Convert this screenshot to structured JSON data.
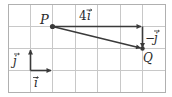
{
  "diagram": {
    "type": "vector-grid",
    "grid": {
      "columns": 7,
      "rows": 4,
      "line_color": "#c8c8c8",
      "border_color": "#b0b0b0"
    },
    "points": [
      {
        "name": "P",
        "label": "P",
        "grid": [
          2,
          1
        ]
      },
      {
        "name": "Q",
        "label": "Q",
        "grid": [
          6,
          2
        ]
      }
    ],
    "vectors": [
      {
        "name": "4i",
        "label_main": "4",
        "label_var": "i",
        "from": [
          2,
          1
        ],
        "to": [
          6,
          1
        ]
      },
      {
        "name": "-j",
        "label_main": "−",
        "label_var": "j",
        "from": [
          6,
          1
        ],
        "to": [
          6,
          2
        ]
      },
      {
        "name": "PQ",
        "label": "",
        "from": [
          2,
          1
        ],
        "to": [
          6,
          2
        ]
      },
      {
        "name": "j",
        "label_var": "j",
        "from": [
          1,
          3
        ],
        "to": [
          1,
          2
        ]
      },
      {
        "name": "i",
        "label_var": "i",
        "from": [
          1,
          3
        ],
        "to": [
          2,
          3
        ]
      }
    ],
    "colors": {
      "vector": "#3a3a3a",
      "text": "#2a2a2a"
    }
  }
}
